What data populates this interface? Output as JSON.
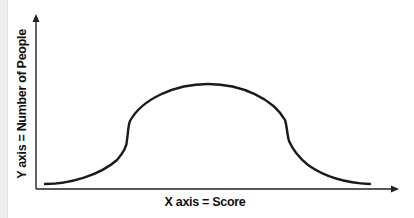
{
  "diagram": {
    "type": "distribution-curve",
    "x_axis": {
      "label": "X axis = Score"
    },
    "y_axis": {
      "label": "Y axis = Number of People"
    },
    "curve": {
      "shape": "bell",
      "color": "#1a1a1a"
    },
    "colors": {
      "axis": "#222222",
      "background": "#ffffff",
      "left_strip": "#eeeeee"
    }
  }
}
